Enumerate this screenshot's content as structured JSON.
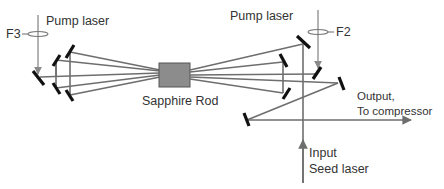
{
  "diagram": {
    "title": "",
    "labels": {
      "pump_left": "Pump laser",
      "pump_right": "Pump laser",
      "lens_left": "F3",
      "lens_right": "F2",
      "crystal": "Sapphire Rod",
      "output_line1": "Output,",
      "output_line2": "To compressor",
      "input_line1": "Input",
      "input_line2": "Seed laser"
    },
    "components": [
      {
        "id": "pump-laser-left",
        "type": "pump-beam"
      },
      {
        "id": "lens-f3",
        "type": "lens"
      },
      {
        "id": "pump-laser-right",
        "type": "pump-beam"
      },
      {
        "id": "lens-f2",
        "type": "lens"
      },
      {
        "id": "sapphire-rod",
        "type": "gain-crystal",
        "color": "#8c8c8c"
      },
      {
        "id": "left-mirror-array",
        "type": "mirrors"
      },
      {
        "id": "right-mirror-array",
        "type": "mirrors"
      },
      {
        "id": "input-seed",
        "type": "input-beam"
      },
      {
        "id": "output-beam",
        "type": "output-beam"
      }
    ],
    "colors": {
      "beam": "#6e6e6e",
      "pump": "#8a8a8a",
      "mirror": "#111111",
      "crystal_fill": "#8c8c8c",
      "crystal_stroke": "#555555",
      "text": "#333333"
    }
  }
}
